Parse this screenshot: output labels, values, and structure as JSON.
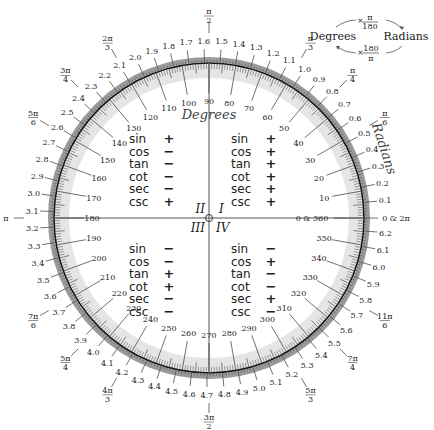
{
  "diagram": {
    "center": {
      "x": 209,
      "y": 218
    },
    "radius": 155,
    "colors": {
      "ring": "#9a9a9a",
      "ring_light": "#cfcfcf",
      "circle": "#111111",
      "tick": "#333333",
      "axis": "#555555",
      "text": "#222222"
    },
    "degrees_title": "Degrees",
    "radians_title": "Radians",
    "degree_labels": [
      {
        "deg": 0,
        "text": "0 & 360"
      },
      {
        "deg": 10,
        "text": "10"
      },
      {
        "deg": 20,
        "text": "20"
      },
      {
        "deg": 30,
        "text": "30"
      },
      {
        "deg": 40,
        "text": "40"
      },
      {
        "deg": 50,
        "text": "50"
      },
      {
        "deg": 60,
        "text": "60"
      },
      {
        "deg": 70,
        "text": "70"
      },
      {
        "deg": 80,
        "text": "80"
      },
      {
        "deg": 90,
        "text": "90"
      },
      {
        "deg": 100,
        "text": "100"
      },
      {
        "deg": 110,
        "text": "110"
      },
      {
        "deg": 120,
        "text": "120"
      },
      {
        "deg": 130,
        "text": "130"
      },
      {
        "deg": 140,
        "text": "140"
      },
      {
        "deg": 150,
        "text": "150"
      },
      {
        "deg": 160,
        "text": "160"
      },
      {
        "deg": 170,
        "text": "170"
      },
      {
        "deg": 180,
        "text": "180"
      },
      {
        "deg": 190,
        "text": "190"
      },
      {
        "deg": 200,
        "text": "200"
      },
      {
        "deg": 210,
        "text": "210"
      },
      {
        "deg": 220,
        "text": "220"
      },
      {
        "deg": 230,
        "text": "230"
      },
      {
        "deg": 240,
        "text": "240"
      },
      {
        "deg": 250,
        "text": "250"
      },
      {
        "deg": 260,
        "text": "260"
      },
      {
        "deg": 270,
        "text": "270"
      },
      {
        "deg": 280,
        "text": "280"
      },
      {
        "deg": 290,
        "text": "290"
      },
      {
        "deg": 300,
        "text": "300"
      },
      {
        "deg": 310,
        "text": "310"
      },
      {
        "deg": 320,
        "text": "320"
      },
      {
        "deg": 330,
        "text": "330"
      },
      {
        "deg": 340,
        "text": "340"
      },
      {
        "deg": 350,
        "text": "350"
      }
    ],
    "radian_labels": [
      {
        "rad": 0,
        "text": "0 & 2π"
      },
      {
        "rad": 0.1,
        "text": "0.1"
      },
      {
        "rad": 0.2,
        "text": "0.2"
      },
      {
        "rad": 0.3,
        "text": "0.3"
      },
      {
        "rad": 0.4,
        "text": "0.4"
      },
      {
        "rad": 0.5,
        "text": "0.5"
      },
      {
        "rad": 0.6,
        "text": "0.6"
      },
      {
        "rad": 0.7,
        "text": "0.7"
      },
      {
        "rad": 0.8,
        "text": "0.8"
      },
      {
        "rad": 0.9,
        "text": "0.9"
      },
      {
        "rad": 1.0,
        "text": "1.0"
      },
      {
        "rad": 1.1,
        "text": "1.1"
      },
      {
        "rad": 1.2,
        "text": "1.2"
      },
      {
        "rad": 1.3,
        "text": "1.3"
      },
      {
        "rad": 1.4,
        "text": "1.4"
      },
      {
        "rad": 1.5,
        "text": "1.5"
      },
      {
        "rad": 1.6,
        "text": "1.6"
      },
      {
        "rad": 1.7,
        "text": "1.7"
      },
      {
        "rad": 1.8,
        "text": "1.8"
      },
      {
        "rad": 1.9,
        "text": "1.9"
      },
      {
        "rad": 2.0,
        "text": "2.0"
      },
      {
        "rad": 2.1,
        "text": "2.1"
      },
      {
        "rad": 2.2,
        "text": "2.2"
      },
      {
        "rad": 2.3,
        "text": "2.3"
      },
      {
        "rad": 2.4,
        "text": "2.4"
      },
      {
        "rad": 2.5,
        "text": "2.5"
      },
      {
        "rad": 2.6,
        "text": "2.6"
      },
      {
        "rad": 2.7,
        "text": "2.7"
      },
      {
        "rad": 2.8,
        "text": "2.8"
      },
      {
        "rad": 2.9,
        "text": "2.9"
      },
      {
        "rad": 3.0,
        "text": "3.0"
      },
      {
        "rad": 3.1,
        "text": "3.1"
      },
      {
        "rad": 3.2,
        "text": "3.2"
      },
      {
        "rad": 3.3,
        "text": "3.3"
      },
      {
        "rad": 3.4,
        "text": "3.4"
      },
      {
        "rad": 3.5,
        "text": "3.5"
      },
      {
        "rad": 3.6,
        "text": "3.6"
      },
      {
        "rad": 3.7,
        "text": "3.7"
      },
      {
        "rad": 3.8,
        "text": "3.8"
      },
      {
        "rad": 3.9,
        "text": "3.9"
      },
      {
        "rad": 4.0,
        "text": "4.0"
      },
      {
        "rad": 4.1,
        "text": "4.1"
      },
      {
        "rad": 4.2,
        "text": "4.2"
      },
      {
        "rad": 4.3,
        "text": "4.3"
      },
      {
        "rad": 4.4,
        "text": "4.4"
      },
      {
        "rad": 4.5,
        "text": "4.5"
      },
      {
        "rad": 4.6,
        "text": "4.6"
      },
      {
        "rad": 4.7,
        "text": "4.7"
      },
      {
        "rad": 4.8,
        "text": "4.8"
      },
      {
        "rad": 4.9,
        "text": "4.9"
      },
      {
        "rad": 5.0,
        "text": "5.0"
      },
      {
        "rad": 5.1,
        "text": "5.1"
      },
      {
        "rad": 5.2,
        "text": "5.2"
      },
      {
        "rad": 5.3,
        "text": "5.3"
      },
      {
        "rad": 5.4,
        "text": "5.4"
      },
      {
        "rad": 5.5,
        "text": "5.5"
      },
      {
        "rad": 5.6,
        "text": "5.6"
      },
      {
        "rad": 5.7,
        "text": "5.7"
      },
      {
        "rad": 5.8,
        "text": "5.8"
      },
      {
        "rad": 5.9,
        "text": "5.9"
      },
      {
        "rad": 6.0,
        "text": "6.0"
      },
      {
        "rad": 6.1,
        "text": "6.1"
      },
      {
        "rad": 6.2,
        "text": "6.2"
      }
    ],
    "pi_labels": [
      {
        "deg": 30,
        "num": "π",
        "den": "6"
      },
      {
        "deg": 45,
        "num": "π",
        "den": "4"
      },
      {
        "deg": 60,
        "num": "π",
        "den": "3"
      },
      {
        "deg": 90,
        "num": "π",
        "den": "2"
      },
      {
        "deg": 120,
        "num": "2π",
        "den": "3"
      },
      {
        "deg": 135,
        "num": "3π",
        "den": "4"
      },
      {
        "deg": 150,
        "num": "5π",
        "den": "6"
      },
      {
        "deg": 180,
        "num": "π",
        "den": ""
      },
      {
        "deg": 210,
        "num": "7π",
        "den": "6"
      },
      {
        "deg": 225,
        "num": "5π",
        "den": "4"
      },
      {
        "deg": 240,
        "num": "4π",
        "den": "3"
      },
      {
        "deg": 270,
        "num": "3π",
        "den": "2"
      },
      {
        "deg": 300,
        "num": "5π",
        "den": "3"
      },
      {
        "deg": 315,
        "num": "7π",
        "den": "4"
      },
      {
        "deg": 330,
        "num": "11π",
        "den": "6"
      }
    ],
    "quadrants": [
      {
        "id": "I",
        "label": "I",
        "signs": {
          "sin": "+",
          "cos": "+",
          "tan": "+",
          "cot": "+",
          "sec": "+",
          "csc": "+"
        }
      },
      {
        "id": "II",
        "label": "II",
        "signs": {
          "sin": "+",
          "cos": "−",
          "tan": "−",
          "cot": "−",
          "sec": "−",
          "csc": "+"
        }
      },
      {
        "id": "III",
        "label": "III",
        "signs": {
          "sin": "−",
          "cos": "−",
          "tan": "+",
          "cot": "+",
          "sec": "−",
          "csc": "−"
        }
      },
      {
        "id": "IV",
        "label": "IV",
        "signs": {
          "sin": "−",
          "cos": "+",
          "tan": "−",
          "cot": "−",
          "sec": "+",
          "csc": "−"
        }
      }
    ],
    "functions": [
      "sin",
      "cos",
      "tan",
      "cot",
      "sec",
      "csc"
    ]
  },
  "conversion": {
    "degrees": "Degrees",
    "radians": "Radians",
    "to_radians": {
      "prefix": "×",
      "num": "π",
      "den": "180"
    },
    "to_degrees": {
      "prefix": "×",
      "num": "180",
      "den": "π"
    }
  }
}
